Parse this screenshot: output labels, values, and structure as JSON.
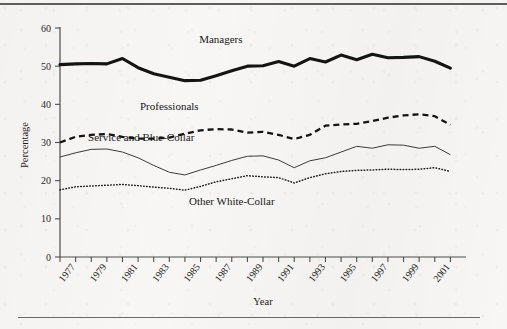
{
  "figure": {
    "background_color": "#f7f6f4",
    "ink_color": "#141414",
    "rule_top": "horizontal-rule",
    "rule_bottom": "horizontal-rule"
  },
  "chart_data": {
    "type": "line",
    "title": "",
    "xlabel": "Year",
    "ylabel": "Percentage",
    "xlim": [
      1976,
      2002
    ],
    "ylim": [
      0,
      60
    ],
    "ytick_values": [
      0,
      10,
      20,
      30,
      40,
      50,
      60
    ],
    "ytick_labels": [
      "0",
      "10",
      "20",
      "30",
      "40",
      "50",
      "60"
    ],
    "grid": false,
    "legend_position": "inline-labels",
    "x": [
      1976,
      1977,
      1978,
      1979,
      1980,
      1981,
      1982,
      1983,
      1984,
      1985,
      1986,
      1987,
      1988,
      1989,
      1990,
      1991,
      1992,
      1993,
      1994,
      1995,
      1996,
      1997,
      1998,
      1999,
      2000,
      2001
    ],
    "xtick_values": [
      1977,
      1979,
      1981,
      1983,
      1985,
      1987,
      1989,
      1991,
      1993,
      1995,
      1997,
      1999,
      2001
    ],
    "xtick_labels": [
      "1977",
      "1979",
      "1981",
      "1983",
      "1985",
      "1987",
      "1989",
      "1991",
      "1993",
      "1995",
      "1997",
      "1999",
      "2001"
    ],
    "xtick_minor_values": [
      1976,
      1978,
      1980,
      1982,
      1984,
      1986,
      1988,
      1990,
      1992,
      1994,
      1996,
      1998,
      2000
    ],
    "series": [
      {
        "name": "Managers",
        "style": "thick-solid",
        "label_text": "Managers",
        "label_x": 1986.3,
        "label_y": 56.0,
        "values": [
          50.4,
          50.6,
          50.7,
          50.6,
          52.0,
          49.6,
          48.0,
          47.1,
          46.2,
          46.3,
          47.5,
          48.8,
          50.0,
          50.1,
          51.2,
          50.0,
          52.0,
          51.1,
          52.9,
          51.7,
          53.1,
          52.2,
          52.3,
          52.5,
          51.3,
          49.5
        ]
      },
      {
        "name": "Professionals",
        "style": "dashed",
        "label_text": "Professionals",
        "label_x": 1983.0,
        "label_y": 38.6,
        "values": [
          30.0,
          31.5,
          32.0,
          32.2,
          31.5,
          31.0,
          31.0,
          31.3,
          32.3,
          33.2,
          33.5,
          33.4,
          32.6,
          32.8,
          32.0,
          30.9,
          32.0,
          34.4,
          34.7,
          34.9,
          35.6,
          36.5,
          37.1,
          37.4,
          36.9,
          34.6
        ]
      },
      {
        "name": "Service and Blue-Collar",
        "style": "thin-solid",
        "label_text": "Service and Blue-Collar",
        "label_x": 1981.2,
        "label_y": 30.4,
        "values": [
          26.2,
          27.3,
          28.2,
          28.3,
          27.5,
          26.0,
          24.0,
          22.2,
          21.5,
          22.8,
          24.0,
          25.3,
          26.4,
          26.5,
          25.4,
          23.4,
          25.2,
          26.0,
          27.5,
          29.0,
          28.5,
          29.4,
          29.3,
          28.5,
          29.0,
          26.8
        ]
      },
      {
        "name": "Other White-Collar",
        "style": "dotted",
        "label_text": "Other White-Collar",
        "label_x": 1987.0,
        "label_y": 13.6,
        "values": [
          17.6,
          18.4,
          18.6,
          18.8,
          19.0,
          18.7,
          18.3,
          18.0,
          17.5,
          18.5,
          19.7,
          20.5,
          21.3,
          21.0,
          20.8,
          19.4,
          20.8,
          21.8,
          22.4,
          22.7,
          22.8,
          23.0,
          22.9,
          23.0,
          23.4,
          22.4
        ]
      }
    ]
  }
}
